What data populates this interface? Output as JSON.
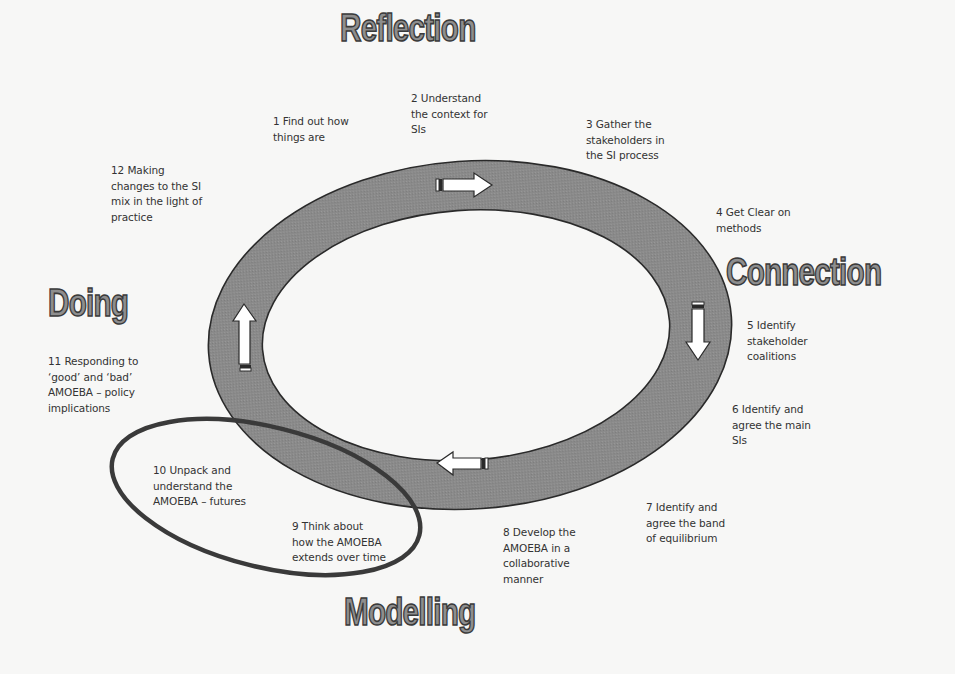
{
  "diagram": {
    "colors": {
      "background": "#f7f7f6",
      "ring_fill": "#8a8a8a",
      "ring_stroke": "#2a2a2a",
      "ellipse_stroke": "#3a3a3a",
      "heading_fill": "#8e8e8e",
      "text": "#333333"
    },
    "phases": {
      "reflection": "Reflection",
      "connection": "Connection",
      "modelling": "Modelling",
      "doing": "Doing"
    },
    "steps": [
      {
        "number": 1,
        "text": "1 Find out how\nthings are"
      },
      {
        "number": 2,
        "text": "2 Understand\nthe context for\nSIs"
      },
      {
        "number": 3,
        "text": "3 Gather the\nstakeholders in\nthe SI process"
      },
      {
        "number": 4,
        "text": "4 Get Clear on\nmethods"
      },
      {
        "number": 5,
        "text": "5 Identify\nstakeholder\ncoalitions"
      },
      {
        "number": 6,
        "text": "6 Identify and\nagree the main\nSIs"
      },
      {
        "number": 7,
        "text": "7 Identify and\nagree the band\nof equilibrium"
      },
      {
        "number": 8,
        "text": "8 Develop the\nAMOEBA in a\ncollaborative\nmanner"
      },
      {
        "number": 9,
        "text": "9 Think about\nhow the AMOEBA\nextends over time"
      },
      {
        "number": 10,
        "text": "10 Unpack and\nunderstand the\nAMOEBA – futures"
      },
      {
        "number": 11,
        "text": "11 Responding to\n‘good’ and ‘bad’\nAMOEBA – policy\nimplications"
      },
      {
        "number": 12,
        "text": "12 Making\nchanges to the SI\nmix in the light of\npractice"
      }
    ],
    "arrows": [
      {
        "position": "top",
        "direction": "right-arrow"
      },
      {
        "position": "right",
        "direction": "down-arrow"
      },
      {
        "position": "bottom",
        "direction": "left-arrow"
      },
      {
        "position": "left",
        "direction": "up-arrow"
      }
    ]
  }
}
